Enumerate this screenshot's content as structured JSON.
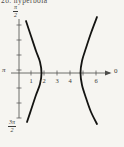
{
  "caption": "28. hyperbola",
  "colors": {
    "background": "#f6f5f1",
    "curve": "#141412",
    "axis": "#4c4c4a",
    "text": "#3a3a38"
  },
  "labels": {
    "theta_top_num": "π",
    "theta_top_den": "2",
    "theta_left": "π",
    "theta_bottom_num": "3π",
    "theta_bottom_den": "2",
    "theta_right": "0"
  },
  "chart_data": {
    "type": "line",
    "title": "hyperbola",
    "description_axes": {
      "polar_angle_labels": [
        "π/2",
        "π",
        "3π/2",
        "0"
      ],
      "radial_tick_values": [
        1,
        2,
        3,
        4,
        5,
        6
      ],
      "radial_tick_labels": [
        "1",
        "2",
        "3",
        "4",
        "",
        "6"
      ]
    },
    "x_axis": {
      "origin_px": 18,
      "unit_px": 13,
      "axis_y_px": 73,
      "x_start_px": 11,
      "x_end_px": 110,
      "tick_values": [
        1,
        2,
        3,
        4,
        5,
        6
      ],
      "tick_labels": [
        "1",
        "2",
        "3",
        "4",
        "",
        "6"
      ],
      "tick_half_px": 2.5,
      "label_baseline_px": 83
    },
    "y_axis": {
      "x_px": 19,
      "top_px": 19,
      "bottom_px": 118,
      "tick_ys_px": [
        25,
        40,
        55,
        70,
        88,
        103,
        118
      ],
      "tick_half_px": 2.5
    },
    "series": [
      {
        "name": "left-branch",
        "vertex_r": 1.8,
        "opens": "left",
        "path_px": [
          [
            26,
            21
          ],
          [
            31,
            36
          ],
          [
            36,
            51
          ],
          [
            40,
            62
          ],
          [
            41.5,
            73
          ],
          [
            40,
            84
          ],
          [
            36,
            95
          ],
          [
            31,
            110
          ],
          [
            27,
            122
          ]
        ]
      },
      {
        "name": "right-branch",
        "vertex_r": 4.8,
        "opens": "right",
        "path_px": [
          [
            97,
            17
          ],
          [
            91,
            33
          ],
          [
            86,
            48
          ],
          [
            82,
            61
          ],
          [
            80.5,
            73
          ],
          [
            82,
            85
          ],
          [
            86,
            98
          ],
          [
            91,
            112
          ],
          [
            97,
            124
          ]
        ]
      }
    ]
  }
}
